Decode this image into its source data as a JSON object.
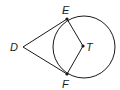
{
  "diagram": {
    "type": "geometry",
    "labels": {
      "D": "D",
      "E": "E",
      "F": "F",
      "T": "T"
    },
    "points": {
      "D": [
        23,
        47
      ],
      "E": [
        67,
        19
      ],
      "F": [
        67,
        74
      ],
      "T": [
        83,
        46
      ]
    },
    "circle": {
      "center": "T",
      "cx": 84,
      "cy": 47,
      "r": 31
    },
    "segments": [
      [
        "D",
        "E"
      ],
      [
        "D",
        "F"
      ],
      [
        "E",
        "T"
      ],
      [
        "F",
        "T"
      ]
    ],
    "colors": {
      "stroke": "#1a1a1a",
      "background": "#ffffff"
    }
  }
}
